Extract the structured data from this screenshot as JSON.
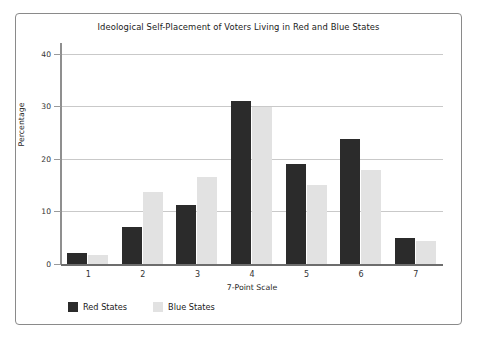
{
  "chart_data": {
    "type": "bar",
    "title": "Ideological Self-Placement of Voters Living in Red and Blue States",
    "xlabel": "7-Point Scale",
    "ylabel": "Percentage",
    "categories": [
      "1",
      "2",
      "3",
      "4",
      "5",
      "6",
      "7"
    ],
    "yticks": [
      0,
      10,
      20,
      30,
      40
    ],
    "ylim": [
      0,
      42
    ],
    "grid": true,
    "legend_position": "bottom-left",
    "series": [
      {
        "name": "Red States",
        "color": "#2b2b2b",
        "values": [
          2.1,
          7.0,
          11.2,
          31.0,
          19.0,
          23.8,
          4.9
        ]
      },
      {
        "name": "Blue States",
        "color": "#e2e2e2",
        "values": [
          1.7,
          13.6,
          16.6,
          29.9,
          15.0,
          17.8,
          4.4
        ]
      }
    ]
  }
}
